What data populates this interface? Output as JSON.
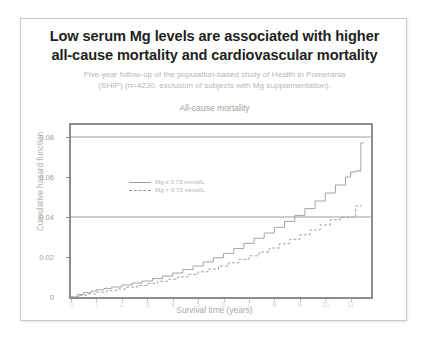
{
  "slide": {
    "title": "Low serum Mg levels are associated with higher all-cause mortality and cardiovascular mortality",
    "title_line1": "Low serum Mg levels are associated with higher",
    "title_line2": "all-cause mortality and cardiovascular mortality",
    "subtitle_line1": "Five-year follow-up of the population-based study of Health in Pomerania",
    "subtitle_line2": "(SHIP) (n=4230, exclusion of subjects with Mg supplementation).",
    "bottom_caption": "",
    "colors": {
      "title": "#231f20",
      "subtitle": "#b7b7b7",
      "axis": "#8d8d8d",
      "curve": "#9a9a9a",
      "card_border": "#c9c9c9"
    }
  },
  "chart_data": {
    "type": "line",
    "title": "All-cause mortality",
    "xlabel": "Survival time (years)",
    "ylabel": "Cumulative hazard function",
    "xlim": [
      0,
      11.8
    ],
    "ylim": [
      0,
      0.086
    ],
    "xticks": [
      0,
      1,
      2,
      3,
      4,
      5,
      6,
      7,
      8,
      9,
      10,
      11
    ],
    "xtick_labels": [
      "0",
      "1",
      "2",
      "3",
      "4",
      "5",
      "6",
      "7",
      "8",
      "9",
      "10",
      "11"
    ],
    "yticks": [
      0,
      0.02,
      0.04,
      0.06,
      0.08
    ],
    "ytick_labels": [
      "0",
      "0.02",
      "0.04",
      "0.06",
      "0.08"
    ],
    "grid": false,
    "reference_lines": [
      0.04,
      0.08
    ],
    "legend_position": "upper-left-inside",
    "series": [
      {
        "name": "Mg ≤ 0.73 mmol/L",
        "style": "solid",
        "color": "#9a9a9a",
        "x": [
          0.0,
          0.25,
          0.5,
          0.8,
          1.0,
          1.3,
          1.6,
          2.0,
          2.4,
          2.8,
          3.2,
          3.6,
          4.0,
          4.4,
          4.8,
          5.2,
          5.6,
          6.0,
          6.4,
          6.8,
          7.2,
          7.6,
          8.0,
          8.4,
          8.8,
          9.2,
          9.6,
          10.0,
          10.4,
          10.8,
          11.0,
          11.2,
          11.4,
          11.5
        ],
        "y": [
          0.0,
          0.0012,
          0.0022,
          0.003,
          0.0036,
          0.0043,
          0.005,
          0.006,
          0.007,
          0.008,
          0.0092,
          0.0105,
          0.012,
          0.0137,
          0.0155,
          0.0175,
          0.0196,
          0.0218,
          0.0242,
          0.0268,
          0.0294,
          0.032,
          0.0348,
          0.0378,
          0.0408,
          0.0442,
          0.048,
          0.052,
          0.056,
          0.06,
          0.0625,
          0.063,
          0.077,
          0.0775
        ]
      },
      {
        "name": "Mg > 0.73 mmol/L",
        "style": "dashed",
        "color": "#9a9a9a",
        "x": [
          0.0,
          0.3,
          0.6,
          1.0,
          1.4,
          1.8,
          2.2,
          2.6,
          3.0,
          3.4,
          3.8,
          4.2,
          4.6,
          5.0,
          5.4,
          5.8,
          6.2,
          6.6,
          7.0,
          7.4,
          7.8,
          8.2,
          8.6,
          9.0,
          9.4,
          9.8,
          10.2,
          10.6,
          11.0,
          11.2,
          11.4
        ],
        "y": [
          0.0,
          0.0008,
          0.0015,
          0.0024,
          0.0032,
          0.004,
          0.0049,
          0.0058,
          0.0068,
          0.0078,
          0.0089,
          0.0101,
          0.0113,
          0.0126,
          0.014,
          0.0155,
          0.0171,
          0.0188,
          0.0206,
          0.0225,
          0.0245,
          0.0266,
          0.0288,
          0.0311,
          0.0335,
          0.036,
          0.0386,
          0.0398,
          0.04,
          0.0455,
          0.046
        ]
      }
    ]
  }
}
